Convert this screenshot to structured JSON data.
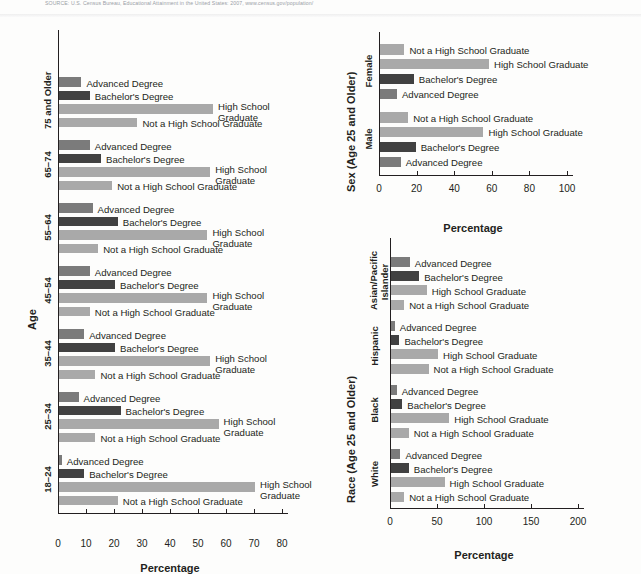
{
  "source": {
    "text": "SOURCE: U.S. Census Bureau, Educational Attainment in the United States: 2007, www.census.gov/population/"
  },
  "series_labels": {
    "advanced": "Advanced Degree",
    "bachelors": "Bachelor's Degree",
    "high_school": "High School Graduate",
    "not_high_school": "Not a High School Graduate",
    "high_school_l1": "High School",
    "high_school_l2": "Graduate"
  },
  "colors": {
    "advanced": "#7b7b7b",
    "bachelors": "#414141",
    "high_school": "#a9a9a9",
    "not_high_school": "#a9a9a9",
    "axis": "#231f20"
  },
  "chart_data": [
    {
      "id": "age-chart",
      "type": "bar",
      "orientation": "horizontal",
      "title": "",
      "xlabel": "Percentage",
      "ylabel": "Age",
      "xlim": [
        0,
        80
      ],
      "xticks": [
        0,
        10,
        20,
        30,
        40,
        50,
        60,
        70,
        80
      ],
      "grid": false,
      "legend": "inline-labels",
      "categories": [
        "18–24",
        "25–34",
        "35–44",
        "45–54",
        "55–64",
        "65–74",
        "75 and Older"
      ],
      "series": [
        {
          "name": "Not a High School Graduate",
          "values": [
            21,
            13,
            13,
            11,
            14,
            19,
            28
          ]
        },
        {
          "name": "High School Graduate",
          "values": [
            70,
            57,
            54,
            53,
            53,
            54,
            55
          ]
        },
        {
          "name": "Bachelor's Degree",
          "values": [
            9,
            22,
            20,
            20,
            21,
            15,
            11
          ]
        },
        {
          "name": "Advanced Degree",
          "values": [
            1,
            7,
            9,
            11,
            12,
            11,
            8
          ]
        }
      ]
    },
    {
      "id": "sex-chart",
      "type": "bar",
      "orientation": "horizontal",
      "title": "",
      "xlabel": "Percentage",
      "ylabel": "Sex (Age 25 and Older)",
      "xlim": [
        0,
        100
      ],
      "xticks": [
        0,
        20,
        40,
        60,
        80,
        100
      ],
      "grid": false,
      "categories": [
        "Male",
        "Female"
      ],
      "series": [
        {
          "name": "Not a High School Graduate",
          "values": [
            15,
            13
          ]
        },
        {
          "name": "High School Graduate",
          "values": [
            55,
            58
          ]
        },
        {
          "name": "Bachelor's Degree",
          "values": [
            19,
            18
          ]
        },
        {
          "name": "Advanced Degree",
          "values": [
            11,
            9
          ]
        }
      ]
    },
    {
      "id": "race-chart",
      "type": "bar",
      "orientation": "horizontal",
      "title": "",
      "xlabel": "Percentage",
      "ylabel": "Race (Age 25 and Older)",
      "xlim": [
        0,
        200
      ],
      "xticks": [
        0,
        50,
        100,
        150,
        200
      ],
      "grid": false,
      "categories": [
        "White",
        "Black",
        "Hispanic",
        "Asian/Pacific Islander"
      ],
      "series": [
        {
          "name": "Not a High School Graduate",
          "values": [
            14,
            19,
            40,
            14
          ]
        },
        {
          "name": "High School Graduate",
          "values": [
            57,
            62,
            50,
            38
          ]
        },
        {
          "name": "Bachelor's Degree",
          "values": [
            19,
            12,
            9,
            30
          ]
        },
        {
          "name": "Advanced Degree",
          "values": [
            10,
            6,
            4,
            20
          ]
        }
      ]
    }
  ]
}
